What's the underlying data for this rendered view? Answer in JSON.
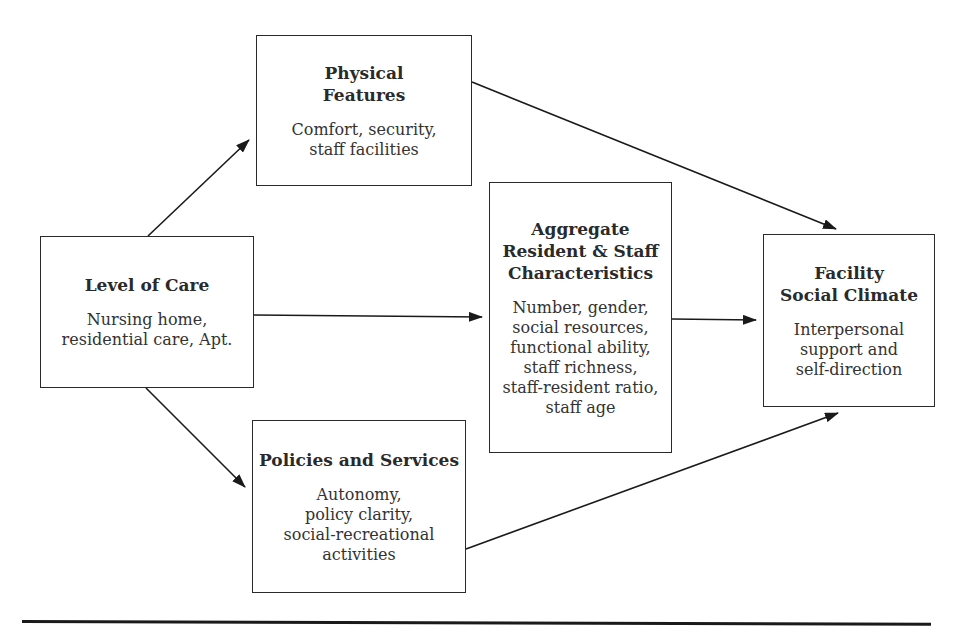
{
  "diagram": {
    "nodes": {
      "level_of_care": {
        "title": "Level of Care",
        "desc": "Nursing home,\nresidential care, Apt."
      },
      "physical_features": {
        "title": "Physical\nFeatures",
        "desc": "Comfort, security,\nstaff facilities"
      },
      "policies_services": {
        "title": "Policies and Services",
        "desc": "Autonomy,\npolicy clarity,\nsocial-recreational\nactivities"
      },
      "aggregate_characteristics": {
        "title": "Aggregate\nResident & Staff\nCharacteristics",
        "desc": "Number, gender,\nsocial resources,\nfunctional ability,\nstaff richness,\nstaff-resident ratio,\nstaff age"
      },
      "social_climate": {
        "title": "Facility\nSocial Climate",
        "desc": "Interpersonal\nsupport and\nself-direction"
      }
    },
    "edges": [
      {
        "from": "Level of Care",
        "to": "Physical Features"
      },
      {
        "from": "Level of Care",
        "to": "Aggregate Resident & Staff Characteristics"
      },
      {
        "from": "Level of Care",
        "to": "Policies and Services"
      },
      {
        "from": "Physical Features",
        "to": "Facility Social Climate"
      },
      {
        "from": "Aggregate Resident & Staff Characteristics",
        "to": "Facility Social Climate"
      },
      {
        "from": "Policies and Services",
        "to": "Facility Social Climate"
      }
    ],
    "colors": {
      "stroke": "#2a2a2a",
      "background": "#ffffff"
    }
  }
}
